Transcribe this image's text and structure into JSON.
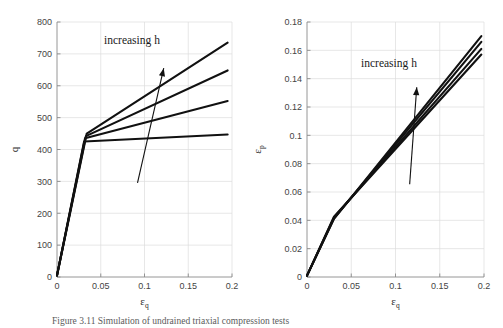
{
  "figure": {
    "caption": "Figure 3.11 Simulation of undrained triaxial compression tests"
  },
  "chart_data": [
    {
      "type": "line",
      "panel": "left",
      "title": "",
      "xlabel": "εq",
      "ylabel": "q",
      "xlim": [
        0,
        0.2
      ],
      "ylim": [
        0,
        800
      ],
      "xticks": [
        0,
        0.05,
        0.1,
        0.15,
        0.2
      ],
      "xticklabels": [
        "0",
        "0.05",
        "0.1",
        "0.15",
        "0.2"
      ],
      "yticks": [
        0,
        100,
        200,
        300,
        400,
        500,
        600,
        700,
        800
      ],
      "yticklabels": [
        "0",
        "100",
        "200",
        "300",
        "400",
        "500",
        "600",
        "700",
        "800"
      ],
      "grid": true,
      "legend": "none",
      "annotation": {
        "text": "increasing h",
        "arrow_from": [
          0.092,
          295
        ],
        "arrow_to": [
          0.122,
          655
        ]
      },
      "series": [
        {
          "name": "h1",
          "x": [
            0,
            0.031,
            0.195
          ],
          "y": [
            5,
            425,
            447
          ]
        },
        {
          "name": "h2",
          "x": [
            0,
            0.032,
            0.195
          ],
          "y": [
            5,
            435,
            552
          ]
        },
        {
          "name": "h3",
          "x": [
            0,
            0.033,
            0.195
          ],
          "y": [
            5,
            442,
            648
          ]
        },
        {
          "name": "h4",
          "x": [
            0,
            0.034,
            0.195
          ],
          "y": [
            5,
            450,
            735
          ]
        }
      ]
    },
    {
      "type": "line",
      "panel": "right",
      "title": "",
      "xlabel": "εq",
      "ylabel": "εp",
      "xlim": [
        0,
        0.2
      ],
      "ylim": [
        0,
        0.18
      ],
      "xticks": [
        0,
        0.05,
        0.1,
        0.15,
        0.2
      ],
      "xticklabels": [
        "0",
        "0.05",
        "0.1",
        "0.15",
        "0.2"
      ],
      "yticks": [
        0,
        0.02,
        0.04,
        0.06,
        0.08,
        0.1,
        0.12,
        0.14,
        0.16,
        0.18
      ],
      "yticklabels": [
        "0",
        "0.02",
        "0.04",
        "0.06",
        "0.08",
        "0.1",
        "0.12",
        "0.14",
        "0.16",
        "0.18"
      ],
      "grid": true,
      "legend": "none",
      "annotation": {
        "text": "increasing h",
        "arrow_from": [
          0.116,
          0.0655
        ],
        "arrow_to": [
          0.124,
          0.134
        ]
      },
      "series": [
        {
          "name": "h1",
          "x": [
            0,
            0.0305,
            0.197
          ],
          "y": [
            0.001,
            0.0425,
            0.157
          ]
        },
        {
          "name": "h2",
          "x": [
            0,
            0.0305,
            0.197
          ],
          "y": [
            0.001,
            0.042,
            0.161
          ]
        },
        {
          "name": "h3",
          "x": [
            0,
            0.0305,
            0.197
          ],
          "y": [
            0.001,
            0.0415,
            0.166
          ]
        },
        {
          "name": "h4",
          "x": [
            0,
            0.0305,
            0.197
          ],
          "y": [
            0.001,
            0.041,
            0.17
          ]
        }
      ]
    }
  ],
  "style": {
    "line_color": "#111111",
    "grid_color": "#dcdcdc",
    "axis_color": "#8a8a8a"
  }
}
